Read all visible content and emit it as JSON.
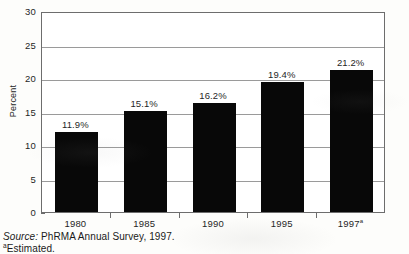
{
  "chart_data": {
    "type": "bar",
    "title": "",
    "subtitle": "",
    "xlabel": "",
    "ylabel": "Percent",
    "categories": [
      "1980",
      "1985",
      "1990",
      "1995",
      "1997"
    ],
    "category_labels_display": [
      "1980",
      "1985",
      "1990",
      "1995",
      "1997"
    ],
    "category_superscripts": [
      "",
      "",
      "",
      "",
      "a"
    ],
    "values": [
      11.9,
      15.1,
      16.2,
      19.4,
      21.2
    ],
    "data_labels": [
      "11.9%",
      "15.1%",
      "16.2%",
      "19.4%",
      "21.2%"
    ],
    "ylim": [
      0,
      30
    ],
    "y_ticks": [
      0,
      5,
      10,
      15,
      20,
      25,
      30
    ],
    "y_tick_labels": [
      "0",
      "5",
      "10",
      "15",
      "20",
      "25",
      "30"
    ],
    "grid": true,
    "grid_axis": "y",
    "legend": false,
    "legend_position": "none",
    "bar_color": "#080808",
    "plot_background": "#ffffff",
    "frame_color": "#6d6d6d",
    "gridline_color": "#9a9a9a"
  },
  "footer": {
    "source_label": "Source:",
    "source_text": "PhRMA Annual Survey, 1997.",
    "footnote_marker": "a",
    "footnote_text": "Estimated."
  }
}
